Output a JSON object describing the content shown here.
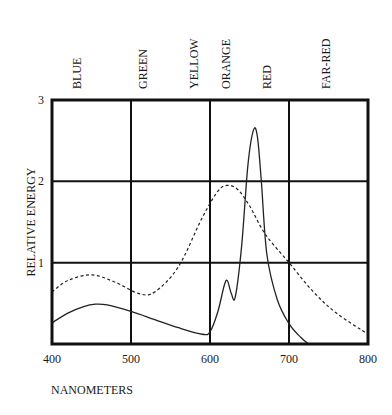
{
  "chart_data": {
    "type": "line",
    "title": "",
    "xlabel": "NANOMETERS",
    "ylabel": "RELATIVE ENERGY",
    "xlim": [
      400,
      800
    ],
    "ylim": [
      0,
      3
    ],
    "x_ticks": [
      "400",
      "500",
      "600",
      "700",
      "800"
    ],
    "y_ticks": [
      "1",
      "2",
      "3"
    ],
    "grid": true,
    "color_bands": [
      "BLUE",
      "GREEN",
      "YELLOW",
      "ORANGE",
      "RED",
      "FAR-RED"
    ],
    "series": [
      {
        "name": "solid",
        "style": "solid",
        "x": [
          400,
          420,
          440,
          455,
          470,
          500,
          530,
          560,
          590,
          600,
          610,
          618,
          622,
          627,
          632,
          640,
          648,
          655,
          660,
          665,
          672,
          685,
          700,
          715,
          725
        ],
        "y": [
          0.26,
          0.38,
          0.46,
          0.49,
          0.48,
          0.4,
          0.3,
          0.2,
          0.12,
          0.15,
          0.4,
          0.72,
          0.78,
          0.62,
          0.58,
          1.2,
          2.2,
          2.63,
          2.55,
          2.0,
          1.1,
          0.55,
          0.25,
          0.08,
          0.0
        ]
      },
      {
        "name": "dashed",
        "style": "dashed",
        "x": [
          400,
          420,
          450,
          480,
          510,
          530,
          560,
          590,
          610,
          622,
          635,
          650,
          670,
          700,
          730,
          760,
          800
        ],
        "y": [
          0.64,
          0.78,
          0.85,
          0.76,
          0.62,
          0.64,
          0.95,
          1.55,
          1.88,
          1.95,
          1.9,
          1.7,
          1.35,
          1.0,
          0.65,
          0.38,
          0.12
        ]
      }
    ]
  }
}
